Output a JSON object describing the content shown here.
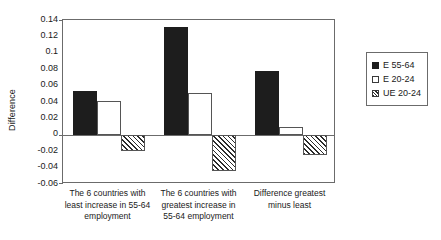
{
  "chart_data": {
    "type": "bar",
    "title": "",
    "xlabel": "",
    "ylabel": "Difference",
    "ylim": [
      -0.06,
      0.14
    ],
    "yticks": [
      "0.14",
      "0.12",
      "0.1",
      "0.08",
      "0.06",
      "0.04",
      "0.02",
      "0",
      "-0.02",
      "-0.04",
      "-0.06"
    ],
    "ytick_values": [
      0.14,
      0.12,
      0.1,
      0.08,
      0.06,
      0.04,
      0.02,
      0,
      -0.02,
      -0.04,
      -0.06
    ],
    "grid": false,
    "legend_position": "right",
    "categories": [
      "The 6 countries with least increase in 55-64 employment",
      "The 6 countries with greatest increase in 55-64 employment",
      "Difference greatest minus least"
    ],
    "category_lines": [
      [
        "The 6 countries with",
        "least increase in 55-64",
        "employment"
      ],
      [
        "The 6 countries with",
        "greatest increase in",
        "55-64 employment"
      ],
      [
        "Difference greatest",
        "minus least"
      ]
    ],
    "series": [
      {
        "name": "E 55-64",
        "fill": "solid",
        "color": "#1d1d1d",
        "values": [
          0.053,
          0.131,
          0.078
        ]
      },
      {
        "name": "E 20-24",
        "fill": "hollow",
        "color": "#ffffff",
        "values": [
          0.041,
          0.051,
          0.009
        ]
      },
      {
        "name": "UE 20-24",
        "fill": "hatched",
        "color": "#ffffff",
        "values": [
          -0.02,
          -0.044,
          -0.025
        ]
      }
    ]
  },
  "legend": {
    "entries": [
      {
        "label": "E 55-64"
      },
      {
        "label": "E 20-24"
      },
      {
        "label": "UE 20-24"
      }
    ]
  }
}
